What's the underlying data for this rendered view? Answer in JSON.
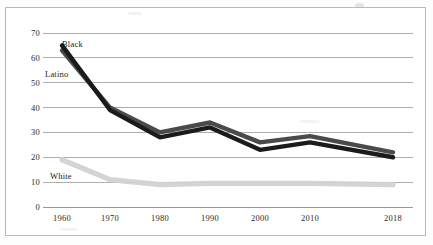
{
  "chart_data": {
    "type": "line",
    "title": "",
    "subtitle": "",
    "xlabel": "",
    "ylabel": "",
    "categories": [
      "1960",
      "1970",
      "1980",
      "1990",
      "2000",
      "2010",
      "2018"
    ],
    "x": [
      1960,
      1970,
      1980,
      1990,
      2000,
      2010,
      2018
    ],
    "ylim": [
      0,
      70
    ],
    "yticks": [
      0,
      10,
      20,
      30,
      40,
      50,
      60,
      70
    ],
    "ytick_labels": [
      "0",
      "10",
      "20",
      "30",
      "40",
      "50",
      "60",
      "70"
    ],
    "xtick_labels": [
      "1960",
      "1970",
      "1980",
      "1990",
      "2000",
      "2010",
      "2018"
    ],
    "grid": true,
    "grid_axis": "y",
    "legend": "inline-labels",
    "series": [
      {
        "name": "Black",
        "label": "Black",
        "color": "#1b1b1b",
        "values": [
          65,
          39,
          28,
          32,
          23,
          26,
          20
        ]
      },
      {
        "name": "Latino",
        "label": "Latino",
        "color": "#4a4a4a",
        "values": [
          63,
          40,
          30,
          34,
          26,
          28.5,
          22
        ]
      },
      {
        "name": "White",
        "label": "White",
        "color": "#d2d2d2",
        "values": [
          19,
          11,
          9,
          9.5,
          9.5,
          9.5,
          9
        ]
      }
    ],
    "annotations": [
      {
        "text": "Black",
        "series": "Black",
        "x": 1960,
        "y": 65
      },
      {
        "text": "Latino",
        "series": "Latino",
        "x": 1960,
        "y": 63
      },
      {
        "text": "White",
        "series": "White",
        "x": 1960,
        "y": 19
      }
    ]
  },
  "style": {
    "background": "#ffffff",
    "frame_color": "#b9b9b9",
    "grid_color": "#8c8c8c",
    "text_color": "#2b2b2b"
  }
}
